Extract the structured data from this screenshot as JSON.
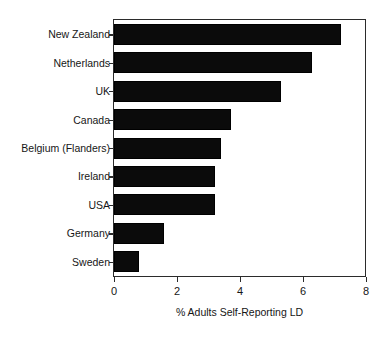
{
  "chart_data": {
    "type": "bar",
    "orientation": "horizontal",
    "title": "",
    "xlabel": "% Adults Self-Reporting LD",
    "ylabel": "",
    "categories": [
      "New Zealand",
      "Netherlands",
      "UK",
      "Canada",
      "Belgium (Flanders)",
      "Ireland",
      "USA",
      "Germany",
      "Sweden"
    ],
    "values": [
      7.2,
      6.3,
      5.3,
      3.7,
      3.4,
      3.2,
      3.2,
      1.6,
      0.8
    ],
    "xlim": [
      0,
      8
    ],
    "xticks": [
      0,
      2,
      4,
      6,
      8
    ],
    "xtick_labels": [
      "0",
      "2",
      "4",
      "6",
      "8"
    ],
    "grid": false,
    "legend": false,
    "bar_color": "#0b0b0b",
    "axis_color": "#2b2b2b",
    "background_color": "#ffffff"
  }
}
